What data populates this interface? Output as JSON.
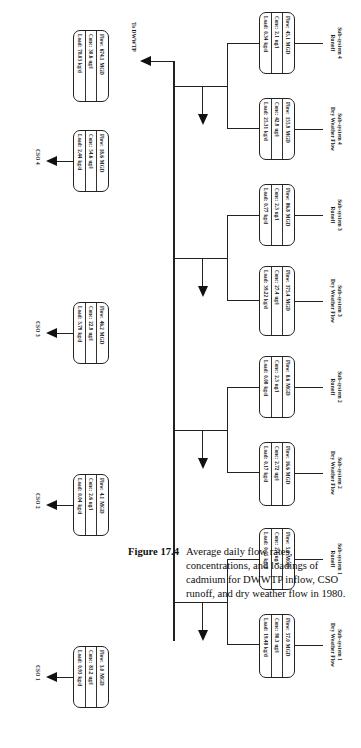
{
  "figure": {
    "number": "Figure 17.4",
    "caption": "Average daily flow rates, concentrations, and loadings of cadmium for DWWTP inflow, CSO runoff, and dry weather flow in 1980."
  },
  "lanes": [
    {
      "system": "Sub-system 1",
      "stream": "Dry Weather Flow"
    },
    {
      "system": "Sub-system 1",
      "stream": "Runoff"
    },
    {
      "system": "Sub-system 2",
      "stream": "Dry Weather Flow"
    },
    {
      "system": "Sub-system 2",
      "stream": "Runoff"
    },
    {
      "system": "Sub-system 3",
      "stream": "Dry Weather Flow"
    },
    {
      "system": "Sub-system 3",
      "stream": "Runoff"
    },
    {
      "system": "Sub-system 4",
      "stream": "Dry Weather Flow"
    },
    {
      "system": "Sub-system 4",
      "stream": "Runoff"
    }
  ],
  "labels": {
    "flow_key": "Flow:",
    "conc_key": "Conc:",
    "load_key": "Load:",
    "unit_flow": "MGD",
    "unit_conc": "ug/l",
    "unit_load": "kg/d"
  },
  "boxes": {
    "s1_dwf": {
      "flow": "57.0",
      "conc": "90.3",
      "load": "19.48"
    },
    "s1_ro": {
      "flow": "5.8",
      "conc": "2.1",
      "load": "0.05"
    },
    "s2_dwf": {
      "flow": "16.6",
      "conc": "2.72",
      "load": "0.17"
    },
    "s2_ro": {
      "flow": "8.6",
      "conc": "2.3",
      "load": "0.08"
    },
    "s3_dwf": {
      "flow": "375.4",
      "conc": "27.4",
      "load": "39.22"
    },
    "s3_ro": {
      "flow": "86.8",
      "conc": "2.3",
      "load": "0.77"
    },
    "s4_dwf": {
      "flow": "155.9",
      "conc": "42.9",
      "load": "25.31"
    },
    "s4_ro": {
      "flow": "45.1",
      "conc": "2.1",
      "load": "0.34"
    },
    "cso1": {
      "flow": "3.0",
      "conc": "83.2",
      "load": "0.93"
    },
    "cso2": {
      "flow": "4.1",
      "conc": "2.6",
      "load": "0.04"
    },
    "cso3": {
      "flow": "46.2",
      "conc": "22.9",
      "load": "3.79"
    },
    "cso4": {
      "flow": "18.6",
      "conc": "54.6",
      "load": "2.44"
    },
    "dwwtp": {
      "flow": "674.1",
      "conc": "30.6",
      "load": "78.03"
    }
  },
  "outputs": {
    "cso1": "CSO 1",
    "cso2": "CSO 2",
    "cso3": "CSO 3",
    "cso4": "CSO 4",
    "dwwtp": "To DWWTP"
  }
}
